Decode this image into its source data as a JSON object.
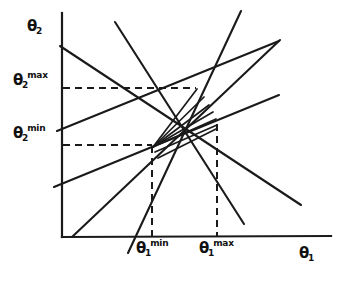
{
  "figure": {
    "background": "#ffffff",
    "line_color": "#1a1a1a",
    "axes": {
      "x_axis_label": "θ",
      "x_axis_sub": "1",
      "y_axis_label": "θ",
      "y_axis_sub": "2",
      "origin_px": [
        62,
        237
      ],
      "x_axis_end_px": [
        331,
        236
      ],
      "y_axis_top_px": [
        62,
        13
      ]
    },
    "tick_labels": {
      "theta2_max": {
        "base": "θ",
        "sub": "2",
        "sup": "max"
      },
      "theta2_min": {
        "base": "θ",
        "sub": "2",
        "sup": "min"
      },
      "theta1_min": {
        "base": "θ",
        "sub": "1",
        "sup": "min"
      },
      "theta1_max": {
        "base": "θ",
        "sub": "1",
        "sup": "max"
      }
    },
    "guide_values_px": {
      "theta2_max_y": 88,
      "theta2_min_y": 145,
      "theta1_min_x": 152,
      "theta1_max_x": 217
    },
    "constraint_lines": [
      {
        "name": "constraint-1-descending-steep",
        "x1": 115,
        "y1": 22,
        "x2": 244,
        "y2": 224
      },
      {
        "name": "constraint-2-descending-shallow",
        "x1": 60,
        "y1": 46,
        "x2": 301,
        "y2": 205
      },
      {
        "name": "constraint-3-ascending-steep",
        "x1": 128,
        "y1": 253,
        "x2": 241,
        "y2": 11
      },
      {
        "name": "constraint-4-ascending-medium",
        "x1": 72,
        "y1": 237,
        "x2": 280,
        "y2": 40
      },
      {
        "name": "constraint-5-ascending-shallow-upper",
        "x1": 57,
        "y1": 131,
        "x2": 279,
        "y2": 41
      },
      {
        "name": "constraint-6-ascending-shallow-lower",
        "x1": 54,
        "y1": 187,
        "x2": 279,
        "y2": 95
      }
    ],
    "dashed_guides": [
      {
        "name": "guide-theta2-max",
        "x1": 63,
        "y1": 88,
        "x2": 196,
        "y2": 88
      },
      {
        "name": "guide-theta2-min",
        "x1": 63,
        "y1": 145,
        "x2": 152,
        "y2": 145
      },
      {
        "name": "guide-theta1-min",
        "x1": 152,
        "y1": 146,
        "x2": 152,
        "y2": 237
      },
      {
        "name": "guide-theta1-max",
        "x1": 217,
        "y1": 124,
        "x2": 217,
        "y2": 237
      }
    ],
    "hatch_lines": [
      {
        "x1": 153,
        "y1": 147,
        "x2": 197,
        "y2": 89
      },
      {
        "x1": 153,
        "y1": 147,
        "x2": 204,
        "y2": 97
      },
      {
        "x1": 153,
        "y1": 147,
        "x2": 209,
        "y2": 105
      },
      {
        "x1": 153,
        "y1": 147,
        "x2": 213,
        "y2": 112
      },
      {
        "x1": 153,
        "y1": 147,
        "x2": 216,
        "y2": 119
      },
      {
        "x1": 155,
        "y1": 152,
        "x2": 217,
        "y2": 125
      },
      {
        "x1": 158,
        "y1": 158,
        "x2": 216,
        "y2": 129
      }
    ],
    "feasible_region_polygon": [
      [
        152,
        146
      ],
      [
        196,
        88
      ],
      [
        217,
        124
      ],
      [
        173,
        176
      ]
    ]
  }
}
